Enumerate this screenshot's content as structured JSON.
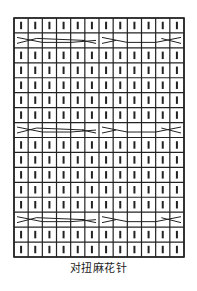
{
  "diagram": {
    "title": "对扭麻花针",
    "columns": 12,
    "rows": 16,
    "grid": {
      "left": 14,
      "top": 18,
      "right": 184,
      "bottom": 257
    },
    "row_types": [
      "K",
      "C",
      "K",
      "K",
      "K",
      "K",
      "K",
      "C",
      "K",
      "K",
      "K",
      "K",
      "K",
      "C",
      "K",
      "K"
    ],
    "symbols": {
      "K": "knit-stitch (vertical bar)",
      "C": "left/right cable cross (6-stitch groups, mirrored)"
    },
    "colors": {
      "line": "#222222",
      "background": "#ffffff"
    }
  }
}
